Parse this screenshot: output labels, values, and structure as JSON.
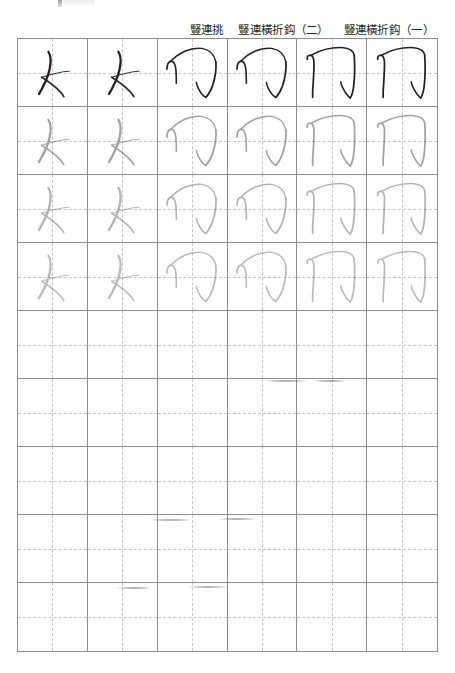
{
  "page": {
    "background_color": "#ffffff",
    "grid_line_color": "#8c8c8c",
    "guide_line_color": "#c9c6c4",
    "ink_color": "#231f20"
  },
  "headers": [
    {
      "label": "",
      "span": 2
    },
    {
      "label": "豎連挑",
      "span": 2
    },
    {
      "label": "豎連橫折鈎（二）",
      "span": 2
    },
    {
      "label": "豎連橫折鈎（一）",
      "span": 2
    }
  ],
  "header_labels_flat": [
    "",
    "豎連挑",
    "豎連橫折鈎（二）",
    "豎連橫折鈎（一）"
  ],
  "grid": {
    "columns": 6,
    "rows": 9,
    "left": 17,
    "top": 38,
    "width": 421,
    "height": 614
  },
  "stroke_types": [
    {
      "id": "shu-lian-tiao",
      "name": "豎連挑",
      "columns": [
        1,
        2
      ]
    },
    {
      "id": "shu-lian-heng-zhe-gou-2",
      "name": "豎連橫折鈎（二）",
      "columns": [
        3,
        4
      ]
    },
    {
      "id": "shu-lian-heng-zhe-gou-1",
      "name": "豎連橫折鈎（一）",
      "columns": [
        5,
        6
      ]
    }
  ],
  "rows": [
    {
      "index": 1,
      "opacity": 1.0,
      "filled": true,
      "note": "model row, full ink"
    },
    {
      "index": 2,
      "opacity": 0.42,
      "filled": true,
      "note": "tracing guide"
    },
    {
      "index": 3,
      "opacity": 0.34,
      "filled": true,
      "note": "tracing guide"
    },
    {
      "index": 4,
      "opacity": 0.3,
      "filled": true,
      "note": "tracing guide"
    },
    {
      "index": 5,
      "opacity": 0.0,
      "filled": false,
      "note": "blank practice"
    },
    {
      "index": 6,
      "opacity": 0.0,
      "filled": false,
      "note": "blank practice"
    },
    {
      "index": 7,
      "opacity": 0.0,
      "filled": false,
      "note": "blank practice"
    },
    {
      "index": 8,
      "opacity": 0.0,
      "filled": false,
      "note": "blank practice"
    },
    {
      "index": 9,
      "opacity": 0.0,
      "filled": false,
      "note": "blank practice"
    }
  ],
  "smudges": [
    {
      "left": 148,
      "top": 519,
      "width": 46
    },
    {
      "left": 216,
      "top": 518,
      "width": 42
    },
    {
      "left": 114,
      "top": 587,
      "width": 40
    },
    {
      "left": 186,
      "top": 586,
      "width": 44
    },
    {
      "left": 262,
      "top": 380,
      "width": 48
    },
    {
      "left": 312,
      "top": 380,
      "width": 36
    }
  ]
}
